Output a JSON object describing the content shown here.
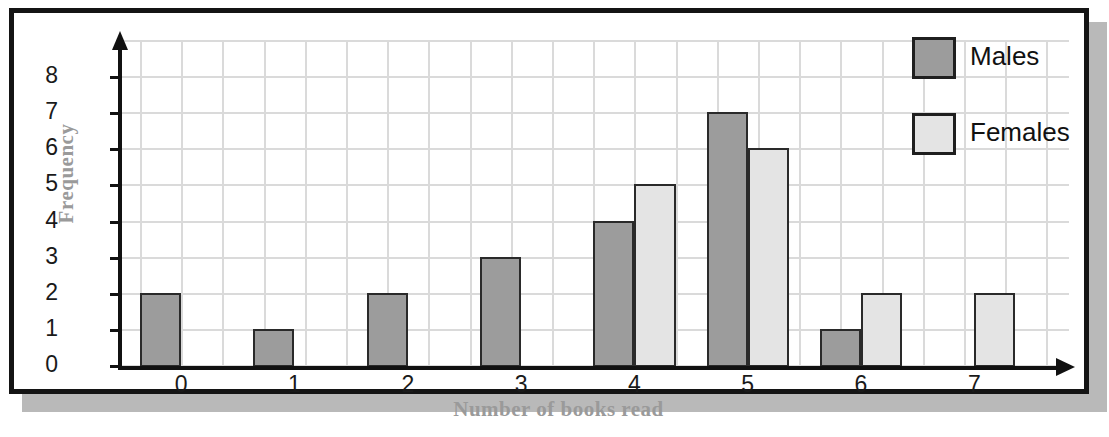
{
  "chart_data": {
    "type": "bar",
    "title": "",
    "xlabel": "Number of books read",
    "ylabel": "Frequency",
    "categories": [
      "0",
      "1",
      "2",
      "3",
      "4",
      "5",
      "6",
      "7"
    ],
    "series": [
      {
        "name": "Males",
        "color": "#9c9c9c",
        "values": [
          2,
          1,
          2,
          3,
          4,
          7,
          1,
          0
        ]
      },
      {
        "name": "Females",
        "color": "#e4e4e4",
        "values": [
          0,
          0,
          0,
          0,
          5,
          6,
          2,
          2
        ]
      }
    ],
    "yticks": [
      "0",
      "1",
      "2",
      "3",
      "4",
      "5",
      "6",
      "7",
      "8"
    ],
    "ylim": [
      0,
      9
    ],
    "grid": true,
    "legend_position": "top-right",
    "legend": [
      {
        "label": "Males",
        "color": "#9c9c9c"
      },
      {
        "label": "Females",
        "color": "#e4e4e4"
      }
    ]
  },
  "colors": {
    "males": "#9c9c9c",
    "females": "#e4e4e4",
    "gridline": "#dadada",
    "axis": "#111111",
    "axis_title": "#9a9a9a",
    "frame": "#141414",
    "shadow": "#b9b9b9"
  }
}
